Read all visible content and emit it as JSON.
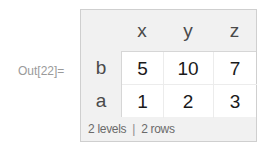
{
  "output_label": "Out[22]=",
  "dataset": {
    "columns": [
      "x",
      "y",
      "z"
    ],
    "rows": [
      {
        "key": "b",
        "values": [
          "5",
          "10",
          "7"
        ]
      },
      {
        "key": "a",
        "values": [
          "1",
          "2",
          "3"
        ]
      }
    ],
    "footer": {
      "levels": "2 levels",
      "separator": "|",
      "rows": "2 rows"
    }
  },
  "colors": {
    "header_bg": "#f1f1f1",
    "body_bg": "#ffffff",
    "border": "#cfcfcf",
    "label_text": "#9a9a9a",
    "header_text": "#4a4a4a",
    "value_text": "#1a1a1a"
  }
}
